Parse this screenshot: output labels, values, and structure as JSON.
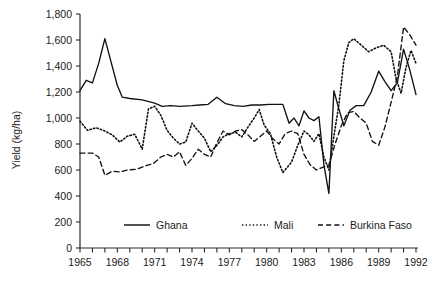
{
  "chart_data": {
    "type": "line",
    "title": "",
    "xlabel": "",
    "ylabel": "Yield (kg/ha)",
    "xlim": [
      1965,
      1992
    ],
    "ylim": [
      0,
      1800
    ],
    "ytick_step": 200,
    "grid": false,
    "legend_position": "inside-bottom",
    "x": [
      1965,
      1966,
      1967,
      1968,
      1969,
      1970,
      1971,
      1972,
      1973,
      1974,
      1975,
      1976,
      1977,
      1978,
      1979,
      1980,
      1981,
      1982,
      1983,
      1984,
      1985,
      1986,
      1987,
      1988,
      1989,
      1990,
      1991,
      1992
    ],
    "xticks": [
      1965,
      1966,
      1967,
      1968,
      1969,
      1970,
      1971,
      1972,
      1973,
      1974,
      1975,
      1976,
      1977,
      1978,
      1979,
      1980,
      1981,
      1982,
      1983,
      1984,
      1985,
      1986,
      1987,
      1988,
      1989,
      1990,
      1991,
      1992
    ],
    "xtick_labels": [
      "1965",
      "",
      "",
      "1968",
      "",
      "",
      "1971",
      "",
      "",
      "1974",
      "",
      "",
      "1977",
      "",
      "",
      "1980",
      "",
      "",
      "1983",
      "",
      "",
      "1986",
      "",
      "",
      "1989",
      "",
      "",
      "1992"
    ],
    "ytick_labels": [
      "0",
      "200",
      "400",
      "600",
      "800",
      "1,000",
      "1,200",
      "1,400",
      "1,600",
      "1,800"
    ],
    "ytick_values": [
      0,
      200,
      400,
      600,
      800,
      1000,
      1200,
      1400,
      1600,
      1800
    ],
    "series": [
      {
        "name": "Ghana",
        "style": "solid",
        "values": [
          1210,
          1280,
          1610,
          1360,
          1160,
          1140,
          1120,
          1090,
          1080,
          1090,
          1100,
          1090,
          1160,
          1100,
          1090,
          1090,
          1100,
          1105,
          1105,
          1040,
          950,
          1000,
          1060,
          900,
          960,
          420,
          1050,
          1200
        ]
      },
      {
        "name": "Mali",
        "style": "dotted",
        "values": [
          975,
          900,
          905,
          900,
          870,
          860,
          790,
          760,
          1065,
          1030,
          920,
          820,
          760,
          810,
          880,
          975,
          900,
          870,
          855,
          850,
          900,
          860,
          840,
          1100,
          1040,
          840,
          760,
          640
        ]
      },
      {
        "name": "Burkina Faso",
        "style": "dashed",
        "values": [
          730,
          730,
          720,
          560,
          590,
          600,
          610,
          620,
          640,
          680,
          730,
          745,
          700,
          720,
          810,
          760,
          700,
          790,
          760,
          600,
          690,
          800,
          880,
          870,
          830,
          690,
          760,
          860
        ]
      }
    ],
    "series_paths": {
      "Ghana": [
        [
          1965.0,
          1210
        ],
        [
          1965.5,
          1290
        ],
        [
          1966.0,
          1270
        ],
        [
          1966.5,
          1420
        ],
        [
          1967.0,
          1610
        ],
        [
          1967.5,
          1430
        ],
        [
          1968.0,
          1250
        ],
        [
          1968.4,
          1160
        ],
        [
          1969.0,
          1150
        ],
        [
          1970.0,
          1140
        ],
        [
          1971.0,
          1115
        ],
        [
          1971.6,
          1090
        ],
        [
          1972.3,
          1095
        ],
        [
          1973.0,
          1090
        ],
        [
          1974.0,
          1095
        ],
        [
          1974.6,
          1100
        ],
        [
          1975.3,
          1105
        ],
        [
          1976.0,
          1160
        ],
        [
          1976.7,
          1110
        ],
        [
          1977.4,
          1095
        ],
        [
          1978.1,
          1090
        ],
        [
          1978.8,
          1100
        ],
        [
          1979.5,
          1100
        ],
        [
          1980.2,
          1105
        ],
        [
          1980.9,
          1105
        ],
        [
          1981.3,
          1105
        ],
        [
          1981.8,
          960
        ],
        [
          1982.2,
          1000
        ],
        [
          1982.6,
          940
        ],
        [
          1983.0,
          1055
        ],
        [
          1983.4,
          1000
        ],
        [
          1983.8,
          980
        ],
        [
          1984.2,
          1010
        ],
        [
          1984.6,
          640
        ],
        [
          1985.0,
          420
        ],
        [
          1985.4,
          1210
        ],
        [
          1985.8,
          1070
        ],
        [
          1986.2,
          940
        ],
        [
          1986.7,
          1060
        ],
        [
          1987.2,
          1095
        ],
        [
          1987.8,
          1095
        ],
        [
          1988.4,
          1200
        ],
        [
          1989.0,
          1360
        ],
        [
          1989.5,
          1280
        ],
        [
          1990.0,
          1210
        ],
        [
          1990.5,
          1270
        ],
        [
          1991.0,
          1530
        ],
        [
          1991.5,
          1370
        ],
        [
          1992.0,
          1180
        ]
      ],
      "Mali": [
        [
          1965.0,
          975
        ],
        [
          1965.6,
          905
        ],
        [
          1966.3,
          925
        ],
        [
          1967.0,
          900
        ],
        [
          1967.6,
          870
        ],
        [
          1968.2,
          815
        ],
        [
          1968.8,
          860
        ],
        [
          1969.4,
          875
        ],
        [
          1970.0,
          760
        ],
        [
          1970.5,
          1070
        ],
        [
          1971.0,
          1090
        ],
        [
          1971.5,
          1020
        ],
        [
          1972.0,
          905
        ],
        [
          1972.5,
          845
        ],
        [
          1973.0,
          800
        ],
        [
          1973.5,
          815
        ],
        [
          1974.0,
          960
        ],
        [
          1974.5,
          900
        ],
        [
          1975.0,
          845
        ],
        [
          1975.5,
          740
        ],
        [
          1976.0,
          790
        ],
        [
          1976.5,
          855
        ],
        [
          1977.0,
          880
        ],
        [
          1977.5,
          890
        ],
        [
          1978.0,
          855
        ],
        [
          1978.5,
          930
        ],
        [
          1979.0,
          1000
        ],
        [
          1979.4,
          1065
        ],
        [
          1979.8,
          945
        ],
        [
          1980.3,
          880
        ],
        [
          1980.8,
          700
        ],
        [
          1981.3,
          580
        ],
        [
          1181.8,
          640
        ],
        [
          1982.0,
          660
        ],
        [
          1982.5,
          790
        ],
        [
          1983.0,
          900
        ],
        [
          1983.4,
          870
        ],
        [
          1983.8,
          820
        ],
        [
          1984.2,
          880
        ],
        [
          1984.6,
          700
        ],
        [
          1985.0,
          600
        ],
        [
          1985.4,
          860
        ],
        [
          1985.8,
          1100
        ],
        [
          1986.2,
          1440
        ],
        [
          1986.6,
          1580
        ],
        [
          1987.0,
          1610
        ],
        [
          1987.6,
          1560
        ],
        [
          1988.2,
          1510
        ],
        [
          1988.8,
          1540
        ],
        [
          1989.4,
          1560
        ],
        [
          1990.0,
          1510
        ],
        [
          1990.4,
          1300
        ],
        [
          1990.8,
          1190
        ],
        [
          1991.2,
          1390
        ],
        [
          1991.6,
          1520
        ],
        [
          1992.0,
          1420
        ]
      ],
      "Burkina Faso": [
        [
          1965.0,
          730
        ],
        [
          1966.0,
          730
        ],
        [
          1966.5,
          700
        ],
        [
          1967.0,
          560
        ],
        [
          1967.6,
          590
        ],
        [
          1968.2,
          585
        ],
        [
          1968.8,
          600
        ],
        [
          1969.5,
          605
        ],
        [
          1970.2,
          630
        ],
        [
          1970.9,
          650
        ],
        [
          1971.5,
          700
        ],
        [
          1972.0,
          720
        ],
        [
          1972.5,
          700
        ],
        [
          1973.0,
          740
        ],
        [
          1973.5,
          635
        ],
        [
          1974.0,
          690
        ],
        [
          1974.5,
          760
        ],
        [
          1975.0,
          720
        ],
        [
          1975.5,
          700
        ],
        [
          1976.0,
          810
        ],
        [
          1976.5,
          900
        ],
        [
          1977.0,
          870
        ],
        [
          1977.5,
          900
        ],
        [
          1978.0,
          910
        ],
        [
          1978.5,
          870
        ],
        [
          1979.0,
          820
        ],
        [
          1979.5,
          860
        ],
        [
          1980.0,
          900
        ],
        [
          1980.5,
          840
        ],
        [
          1981.0,
          800
        ],
        [
          1981.5,
          880
        ],
        [
          1982.0,
          900
        ],
        [
          1982.5,
          880
        ],
        [
          1983.0,
          720
        ],
        [
          1983.5,
          640
        ],
        [
          1984.0,
          600
        ],
        [
          1984.5,
          620
        ],
        [
          1985.0,
          640
        ],
        [
          1985.5,
          800
        ],
        [
          1986.0,
          940
        ],
        [
          1986.5,
          1040
        ],
        [
          1987.0,
          1050
        ],
        [
          1987.5,
          1000
        ],
        [
          1988.0,
          960
        ],
        [
          1988.5,
          820
        ],
        [
          1989.0,
          790
        ],
        [
          1989.5,
          930
        ],
        [
          1990.0,
          1120
        ],
        [
          1990.5,
          1320
        ],
        [
          1991.0,
          1700
        ],
        [
          1991.5,
          1640
        ],
        [
          1992.0,
          1560
        ]
      ]
    }
  },
  "axis": {
    "y_title": "Yield (kg/ha)"
  },
  "legend": {
    "items": [
      {
        "label": "Ghana",
        "style": "solid"
      },
      {
        "label": "Mali",
        "style": "dotted"
      },
      {
        "label": "Burkina Faso",
        "style": "dashed"
      }
    ]
  },
  "colors": {
    "line": "#111111",
    "axis": "#2b2b2b",
    "background": "#ffffff"
  }
}
